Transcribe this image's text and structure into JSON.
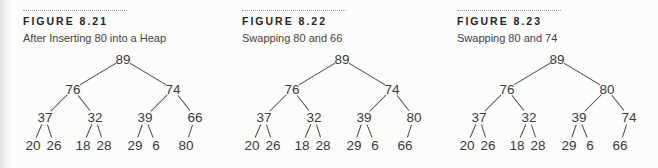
{
  "colors": {
    "background": "#fcfcfa",
    "heading_text": "#262626",
    "caption_text": "#434343",
    "node_text": "#3a3a3a",
    "edge_line": "#4f4f4f",
    "dotted_rule": "#999999"
  },
  "figures": [
    {
      "label": "FIGURE 8.21",
      "caption": "After Inserting 80 into a Heap",
      "tree": {
        "nodes": [
          {
            "v": "89",
            "x": 100,
            "y": 10
          },
          {
            "v": "76",
            "x": 50,
            "y": 40
          },
          {
            "v": "74",
            "x": 150,
            "y": 40
          },
          {
            "v": "37",
            "x": 22,
            "y": 68
          },
          {
            "v": "32",
            "x": 72,
            "y": 68
          },
          {
            "v": "39",
            "x": 122,
            "y": 68
          },
          {
            "v": "66",
            "x": 172,
            "y": 68
          },
          {
            "v": "20",
            "x": 10,
            "y": 96
          },
          {
            "v": "26",
            "x": 31,
            "y": 96
          },
          {
            "v": "18",
            "x": 60,
            "y": 96
          },
          {
            "v": "28",
            "x": 81,
            "y": 96
          },
          {
            "v": "29",
            "x": 112,
            "y": 96
          },
          {
            "v": "6",
            "x": 133,
            "y": 96
          },
          {
            "v": "80",
            "x": 163,
            "y": 96
          }
        ],
        "edges": [
          [
            0,
            1
          ],
          [
            0,
            2
          ],
          [
            1,
            3
          ],
          [
            1,
            4
          ],
          [
            2,
            5
          ],
          [
            2,
            6
          ],
          [
            3,
            7
          ],
          [
            3,
            8
          ],
          [
            4,
            9
          ],
          [
            4,
            10
          ],
          [
            5,
            11
          ],
          [
            5,
            12
          ],
          [
            6,
            13
          ]
        ]
      }
    },
    {
      "label": "FIGURE 8.22",
      "caption": "Swapping 80 and 66",
      "tree": {
        "nodes": [
          {
            "v": "89",
            "x": 100,
            "y": 10
          },
          {
            "v": "76",
            "x": 50,
            "y": 40
          },
          {
            "v": "74",
            "x": 150,
            "y": 40
          },
          {
            "v": "37",
            "x": 22,
            "y": 68
          },
          {
            "v": "32",
            "x": 72,
            "y": 68
          },
          {
            "v": "39",
            "x": 122,
            "y": 68
          },
          {
            "v": "80",
            "x": 172,
            "y": 68
          },
          {
            "v": "20",
            "x": 10,
            "y": 96
          },
          {
            "v": "26",
            "x": 31,
            "y": 96
          },
          {
            "v": "18",
            "x": 60,
            "y": 96
          },
          {
            "v": "28",
            "x": 81,
            "y": 96
          },
          {
            "v": "29",
            "x": 112,
            "y": 96
          },
          {
            "v": "6",
            "x": 133,
            "y": 96
          },
          {
            "v": "66",
            "x": 163,
            "y": 96
          }
        ],
        "edges": [
          [
            0,
            1
          ],
          [
            0,
            2
          ],
          [
            1,
            3
          ],
          [
            1,
            4
          ],
          [
            2,
            5
          ],
          [
            2,
            6
          ],
          [
            3,
            7
          ],
          [
            3,
            8
          ],
          [
            4,
            9
          ],
          [
            4,
            10
          ],
          [
            5,
            11
          ],
          [
            5,
            12
          ],
          [
            6,
            13
          ]
        ]
      }
    },
    {
      "label": "FIGURE 8.23",
      "caption": "Swapping 80 and 74",
      "tree": {
        "nodes": [
          {
            "v": "89",
            "x": 100,
            "y": 10
          },
          {
            "v": "76",
            "x": 50,
            "y": 40
          },
          {
            "v": "80",
            "x": 150,
            "y": 40
          },
          {
            "v": "37",
            "x": 22,
            "y": 68
          },
          {
            "v": "32",
            "x": 72,
            "y": 68
          },
          {
            "v": "39",
            "x": 122,
            "y": 68
          },
          {
            "v": "74",
            "x": 172,
            "y": 68
          },
          {
            "v": "20",
            "x": 10,
            "y": 96
          },
          {
            "v": "26",
            "x": 31,
            "y": 96
          },
          {
            "v": "18",
            "x": 60,
            "y": 96
          },
          {
            "v": "28",
            "x": 81,
            "y": 96
          },
          {
            "v": "29",
            "x": 112,
            "y": 96
          },
          {
            "v": "6",
            "x": 133,
            "y": 96
          },
          {
            "v": "66",
            "x": 163,
            "y": 96
          }
        ],
        "edges": [
          [
            0,
            1
          ],
          [
            0,
            2
          ],
          [
            1,
            3
          ],
          [
            1,
            4
          ],
          [
            2,
            5
          ],
          [
            2,
            6
          ],
          [
            3,
            7
          ],
          [
            3,
            8
          ],
          [
            4,
            9
          ],
          [
            4,
            10
          ],
          [
            5,
            11
          ],
          [
            5,
            12
          ],
          [
            6,
            13
          ]
        ]
      }
    }
  ]
}
